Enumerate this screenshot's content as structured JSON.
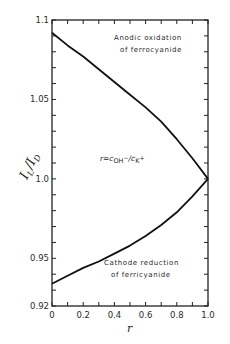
{
  "chart_data": {
    "type": "line",
    "title": "",
    "xlabel": "r",
    "ylabel": "I_L / I_D",
    "xlim": [
      0,
      1.0
    ],
    "ylim": [
      0.92,
      1.1
    ],
    "grid": false,
    "x_ticks": [
      "0",
      "0.2",
      "0.4",
      "0.6",
      "0.8",
      "1.0"
    ],
    "y_ticks": [
      "0.92",
      "0.95",
      "1.0",
      "1.05",
      "1.1"
    ],
    "series": [
      {
        "name": "Anodic oxidation of ferrocyanide",
        "x": [
          0,
          0.1,
          0.2,
          0.3,
          0.4,
          0.5,
          0.6,
          0.7,
          0.8,
          0.9,
          1.0
        ],
        "y": [
          1.092,
          1.084,
          1.077,
          1.069,
          1.061,
          1.053,
          1.045,
          1.036,
          1.025,
          1.013,
          1.0
        ]
      },
      {
        "name": "Cathode reduction of ferricyanide",
        "x": [
          0,
          0.1,
          0.2,
          0.3,
          0.4,
          0.5,
          0.6,
          0.7,
          0.8,
          0.9,
          1.0
        ],
        "y": [
          0.934,
          0.939,
          0.944,
          0.948,
          0.953,
          0.958,
          0.964,
          0.971,
          0.979,
          0.989,
          1.0
        ]
      }
    ],
    "annotations": [
      {
        "text_line1": "Anodic  oxidation",
        "text_line2": "of ferrocyanide"
      },
      {
        "text": "r = c_OH- / c_K+",
        "r_part": "r=c",
        "oh": "OH",
        "minus": "−",
        "slash": "/c",
        "k": "K",
        "plus": "+"
      },
      {
        "text_line1": "Cathode  reduction",
        "text_line2": "of ferricyanide"
      }
    ]
  },
  "labels": {
    "y_axis_main": "I",
    "y_axis_sub_L": "L",
    "y_axis_slash": "/",
    "y_axis_main2": "I",
    "y_axis_sub_D": "D",
    "x_axis": "r"
  }
}
